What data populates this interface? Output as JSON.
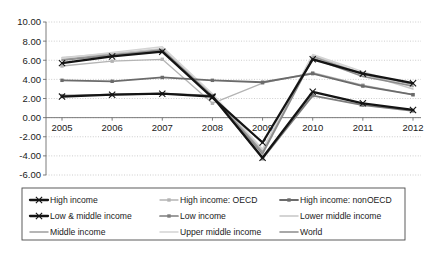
{
  "chart_data": {
    "type": "line",
    "title": "",
    "subtitle": "",
    "xlabel": "",
    "ylabel": "",
    "grid": true,
    "legend_position": "bottom",
    "x": [
      "2005",
      "2006",
      "2007",
      "2008",
      "2009",
      "2010",
      "2011",
      "2012"
    ],
    "xlim": [
      "2005",
      "2012"
    ],
    "ylim": [
      -6.0,
      10.0
    ],
    "ytick_labels": [
      "10.00",
      "8.00",
      "6.00",
      "4.00",
      "2.00",
      "0.00",
      "-2.00",
      "-4.00",
      "-6.00"
    ],
    "ytick_values": [
      10.0,
      8.0,
      6.0,
      4.0,
      2.0,
      0.0,
      -2.0,
      -4.0,
      -6.0
    ],
    "series": [
      {
        "name": "High income",
        "color": "#141414",
        "width": 2.3,
        "marker": "x",
        "values": [
          5.7,
          6.4,
          6.9,
          2.1,
          -2.6,
          6.1,
          4.6,
          3.6
        ]
      },
      {
        "name": "High income: OECD",
        "color": "#b4b4b4",
        "width": 1.3,
        "marker": "square",
        "values": [
          5.4,
          5.9,
          6.1,
          1.5,
          3.6,
          4.7,
          3.4,
          2.4
        ]
      },
      {
        "name": "High income: nonOECD",
        "color": "#6b6b6b",
        "width": 1.8,
        "marker": "square",
        "values": [
          3.9,
          3.8,
          4.2,
          3.9,
          3.7,
          4.6,
          3.3,
          2.4
        ]
      },
      {
        "name": "Low & middle income",
        "color": "#141414",
        "width": 2.3,
        "marker": "x",
        "values": [
          2.2,
          2.4,
          2.5,
          2.2,
          -4.2,
          2.7,
          1.5,
          0.8
        ]
      },
      {
        "name": "Low income",
        "color": "#7d7d7d",
        "width": 1.7,
        "marker": "square",
        "values": [
          2.3,
          2.4,
          2.5,
          2.3,
          -4.3,
          2.3,
          1.3,
          0.7
        ]
      },
      {
        "name": "Lower middle income",
        "color": "#c6c6c6",
        "width": 1.5,
        "marker": "none",
        "values": [
          6.3,
          6.7,
          7.2,
          2.4,
          -3.4,
          6.5,
          4.6,
          3.0
        ]
      },
      {
        "name": "Middle income",
        "color": "#9e9e9e",
        "width": 1.5,
        "marker": "none",
        "values": [
          6.1,
          6.6,
          7.0,
          2.3,
          -3.6,
          6.4,
          4.5,
          3.5
        ]
      },
      {
        "name": "Upper middle income",
        "color": "#d4d4d4",
        "width": 1.5,
        "marker": "none",
        "values": [
          6.2,
          6.8,
          7.4,
          2.5,
          -3.3,
          6.6,
          4.8,
          3.2
        ]
      },
      {
        "name": "World",
        "color": "#8c8c8c",
        "width": 1.6,
        "marker": "none",
        "values": [
          6.0,
          6.5,
          7.1,
          2.2,
          -3.8,
          6.2,
          4.3,
          3.3
        ]
      }
    ],
    "legend_rows": [
      [
        "High income",
        "High income: OECD",
        "High income: nonOECD"
      ],
      [
        "Low & middle income",
        "Low income",
        "Lower middle income"
      ],
      [
        "Middle income",
        "Upper middle income",
        "World"
      ]
    ]
  }
}
